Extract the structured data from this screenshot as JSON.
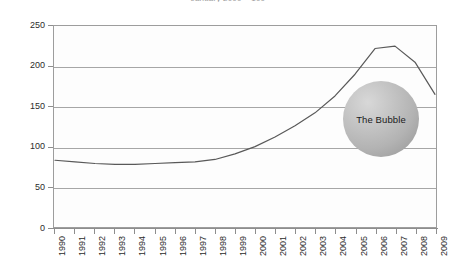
{
  "chart_data": {
    "type": "line",
    "title": "January 2000 = 100",
    "xlabel": "",
    "ylabel": "",
    "ylim": [
      0,
      250
    ],
    "yticks": [
      0,
      50,
      100,
      150,
      200,
      250
    ],
    "grid": true,
    "legend": false,
    "categories": [
      "1990",
      "1991",
      "1992",
      "1993",
      "1994",
      "1995",
      "1996",
      "1997",
      "1998",
      "1999",
      "2000",
      "2001",
      "2002",
      "2003",
      "2004",
      "2005",
      "2006",
      "2007",
      "2008",
      "2009"
    ],
    "values": [
      83,
      81,
      79,
      78,
      78,
      79,
      80,
      81,
      84,
      91,
      100,
      112,
      126,
      142,
      163,
      190,
      222,
      225,
      205,
      165
    ],
    "series": [
      {
        "name": "Index",
        "values": [
          83,
          81,
          79,
          78,
          78,
          79,
          80,
          81,
          84,
          91,
          100,
          112,
          126,
          142,
          163,
          190,
          222,
          225,
          205,
          165
        ],
        "color": "#595959"
      }
    ],
    "annotations": [
      {
        "kind": "bubble-circle",
        "label": "The Bubble",
        "color": "#b3b3b3"
      }
    ]
  },
  "axes": {
    "y_tick_labels": [
      "250",
      "200",
      "150",
      "100",
      "50",
      "0"
    ],
    "x_tick_labels": [
      "1990",
      "1991",
      "1992",
      "1993",
      "1994",
      "1995",
      "1996",
      "1997",
      "1998",
      "1999",
      "2000",
      "2001",
      "2002",
      "2003",
      "2004",
      "2005",
      "2006",
      "2007",
      "2008",
      "2009"
    ]
  },
  "colors": {
    "line": "#595959",
    "grid": "#a6a6a6",
    "axis": "#8d8d8d",
    "plot_background": "#fdfdfd",
    "page_background": "#ffffff",
    "bubble": "#b3b3b3",
    "text": "#2b2b2b"
  }
}
